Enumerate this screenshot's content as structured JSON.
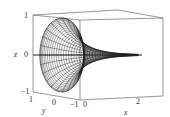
{
  "chart_data": {
    "type": "surface3d",
    "title": "",
    "xlabel": "x",
    "ylabel": "y",
    "zlabel": "z",
    "x_ticks": [
      "0",
      "2"
    ],
    "y_ticks": [
      "1",
      "0",
      "-1"
    ],
    "z_ticks": [
      "1",
      "0",
      "-1"
    ],
    "xlim": [
      0,
      3
    ],
    "ylim": [
      -1,
      1
    ],
    "zlim": [
      -1,
      1
    ],
    "surface": {
      "x": [
        0,
        0.25,
        0.5,
        0.75,
        1.0,
        1.25,
        1.5,
        1.75,
        2.0,
        2.25,
        2.5
      ],
      "radius": [
        1.0,
        0.78,
        0.6,
        0.47,
        0.37,
        0.29,
        0.22,
        0.17,
        0.13,
        0.1,
        0.08
      ]
    },
    "grid": false,
    "box": true
  },
  "colors": {
    "wire": "#222222",
    "box": "#555555",
    "text": "#333333"
  },
  "labels": {
    "z_axis": "z",
    "z_top": "1",
    "z_mid": "0",
    "z_bot": "−1",
    "y_axis": "y",
    "y_left": "1",
    "y_mid": "0",
    "y_right": "−1",
    "x_axis": "x",
    "x_zero": "0",
    "x_two": "2"
  }
}
